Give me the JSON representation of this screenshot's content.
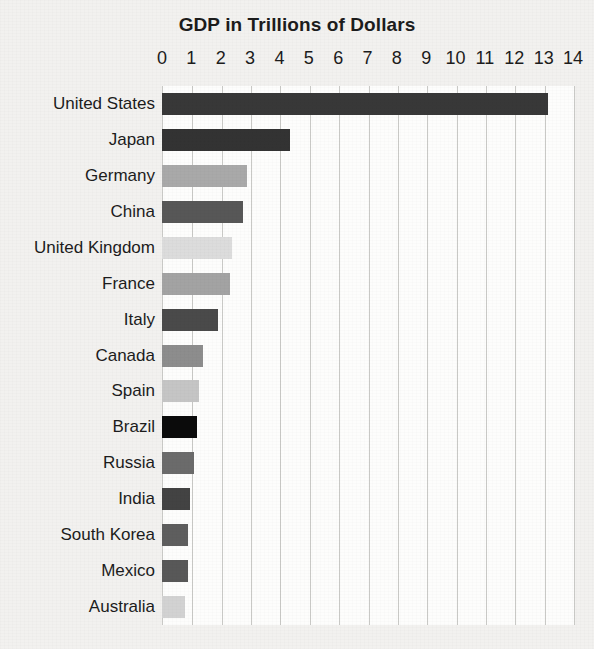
{
  "chart_data": {
    "type": "bar",
    "orientation": "horizontal",
    "title": "GDP in Trillions of Dollars",
    "xlabel": "",
    "ylabel": "",
    "xlim": [
      0,
      14
    ],
    "ylim": null,
    "grid": true,
    "legend": false,
    "legend_position": "none",
    "xticks": [
      "0",
      "1",
      "2",
      "3",
      "4",
      "5",
      "6",
      "7",
      "8",
      "9",
      "10",
      "11",
      "12",
      "13",
      "14"
    ],
    "xtick_values": [
      0,
      1,
      2,
      3,
      4,
      5,
      6,
      7,
      8,
      9,
      10,
      11,
      12,
      13,
      14
    ],
    "categories": [
      "United States",
      "Japan",
      "Germany",
      "China",
      "United Kingdom",
      "France",
      "Italy",
      "Canada",
      "Spain",
      "Brazil",
      "Russia",
      "India",
      "South Korea",
      "Mexico",
      "Australia"
    ],
    "values": [
      13.15,
      4.35,
      2.9,
      2.75,
      2.4,
      2.3,
      1.9,
      1.4,
      1.25,
      1.2,
      1.1,
      0.95,
      0.9,
      0.88,
      0.8
    ],
    "bar_colors": [
      "#383838",
      "#333333",
      "#a9a9a9",
      "#575757",
      "#dcdcdc",
      "#a3a3a3",
      "#4a4a4a",
      "#8d8d8d",
      "#c5c5c5",
      "#0b0b0b",
      "#6b6b6b",
      "#434343",
      "#5e5e5e",
      "#585858",
      "#d2d2d2"
    ],
    "background_color": "#f2f1ef",
    "plot_background_color": "#fdfdfc",
    "gridline_color": "#c9c9c6",
    "text_color": "#1c1c1c"
  }
}
